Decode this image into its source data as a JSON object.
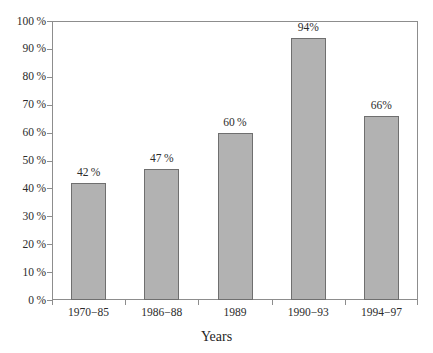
{
  "chart_data": {
    "type": "bar",
    "title": "",
    "subtitle": "",
    "xlabel": "Years",
    "ylabel": "",
    "categories": [
      "1970−85",
      "1986−88",
      "1989",
      "1990−93",
      "1994−97"
    ],
    "values": [
      42,
      47,
      60,
      94,
      66
    ],
    "value_labels": [
      "42 %",
      "47 %",
      "60 %",
      "94%",
      "66%"
    ],
    "ylim": [
      0,
      100
    ],
    "y_tick_values": [
      0,
      10,
      20,
      30,
      40,
      50,
      60,
      70,
      80,
      90,
      100
    ],
    "y_tick_labels": [
      "0 %",
      "10 %",
      "20 %",
      "30 %",
      "40 %",
      "50 %",
      "60 %",
      "70 %",
      "80 %",
      "90 %",
      "100 %"
    ],
    "grid": false,
    "legend": null,
    "legend_position": "none",
    "bar_fill_color": "#b2b2b2",
    "bar_border_color": "#6f6f6f",
    "axis_color": "#8d8d8d",
    "text_color": "#2b2b2b",
    "background_color": "#ffffff"
  },
  "figure": {
    "top_sliver_text": "",
    "x_axis_title": "Years"
  }
}
